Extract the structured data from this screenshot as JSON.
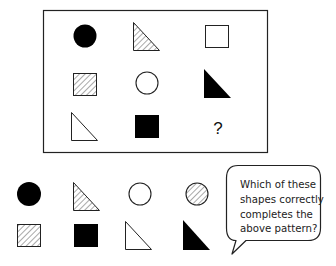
{
  "puzzle": {
    "grid": [
      [
        {
          "shape": "circle",
          "fill": "black"
        },
        {
          "shape": "triangle",
          "fill": "hatched"
        },
        {
          "shape": "square",
          "fill": "white"
        }
      ],
      [
        {
          "shape": "square",
          "fill": "hatched"
        },
        {
          "shape": "circle",
          "fill": "white"
        },
        {
          "shape": "triangle",
          "fill": "black"
        }
      ],
      [
        {
          "shape": "triangle",
          "fill": "white"
        },
        {
          "shape": "square",
          "fill": "black"
        },
        {
          "shape": "unknown",
          "label": "?"
        }
      ]
    ],
    "missing_label": "?"
  },
  "options": [
    {
      "shape": "circle",
      "fill": "black"
    },
    {
      "shape": "triangle",
      "fill": "hatched"
    },
    {
      "shape": "circle",
      "fill": "white"
    },
    {
      "shape": "circle",
      "fill": "hatched"
    },
    {
      "shape": "square",
      "fill": "hatched"
    },
    {
      "shape": "square",
      "fill": "black"
    },
    {
      "shape": "triangle",
      "fill": "white"
    },
    {
      "shape": "triangle",
      "fill": "black"
    }
  ],
  "bubble": {
    "lines": [
      "Which of these",
      "shapes correctly",
      "completes the",
      "above pattern?"
    ]
  },
  "colors": {
    "stroke": "#111111",
    "fill_black": "#000000",
    "hatch": "#777777"
  }
}
